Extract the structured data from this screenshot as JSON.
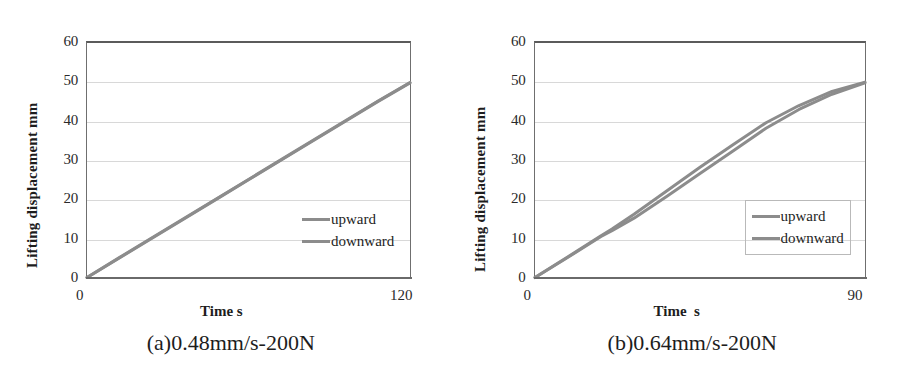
{
  "figure": {
    "background": "#ffffff",
    "series_color": "#8c8c8c",
    "grid_color": "#d8d8d8",
    "axis_color": "#6a6a6a"
  },
  "panels": [
    {
      "id": "a",
      "caption": "(a)0.48mm/s-200N",
      "xlabel": "Time s",
      "ylabel": "Lifting displacement mm",
      "xtick_min": "0",
      "xtick_max": "120",
      "yticks": [
        "60",
        "50",
        "40",
        "30",
        "20",
        "10",
        "0"
      ],
      "legend": [
        {
          "label": "upward",
          "color": "#8c8c8c"
        },
        {
          "label": "downward",
          "color": "#8c8c8c"
        }
      ]
    },
    {
      "id": "b",
      "caption": "(b)0.64mm/s-200N",
      "xlabel": "Time  s",
      "ylabel": "Lifting displacement  mm",
      "xtick_min": "0",
      "xtick_max": "90",
      "yticks": [
        "60",
        "50",
        "40",
        "30",
        "20",
        "10",
        "0"
      ],
      "legend": [
        {
          "label": "upward",
          "color": "#8c8c8c"
        },
        {
          "label": "downward",
          "color": "#8c8c8c"
        }
      ]
    }
  ],
  "chart_data": [
    {
      "type": "line",
      "panel": "a",
      "title": "(a)0.48mm/s-200N",
      "xlabel": "Time s",
      "ylabel": "Lifting displacement mm",
      "xlim": [
        0,
        120
      ],
      "ylim": [
        0,
        60
      ],
      "xticks": [
        0,
        120
      ],
      "yticks": [
        0,
        10,
        20,
        30,
        40,
        50,
        60
      ],
      "grid": "horizontal",
      "legend_position": "inside-right",
      "series": [
        {
          "name": "upward",
          "color": "#8c8c8c",
          "x": [
            0,
            12,
            24,
            36,
            48,
            60,
            72,
            84,
            96,
            108,
            120
          ],
          "values": [
            0,
            5.0,
            10.0,
            15.0,
            20.0,
            25.0,
            30.0,
            35.0,
            40.0,
            45.0,
            49.8
          ]
        },
        {
          "name": "downward",
          "color": "#8c8c8c",
          "x": [
            0,
            12,
            24,
            36,
            48,
            60,
            72,
            84,
            96,
            108,
            120
          ],
          "values": [
            0,
            5.1,
            10.1,
            15.1,
            20.1,
            25.1,
            30.1,
            35.1,
            40.1,
            45.1,
            49.9
          ]
        }
      ]
    },
    {
      "type": "line",
      "panel": "b",
      "title": "(b)0.64mm/s-200N",
      "xlabel": "Time  s",
      "ylabel": "Lifting displacement  mm",
      "xlim": [
        0,
        90
      ],
      "ylim": [
        0,
        60
      ],
      "xticks": [
        0,
        90
      ],
      "yticks": [
        0,
        10,
        20,
        30,
        40,
        50,
        60
      ],
      "grid": "horizontal",
      "legend_position": "inside-right",
      "series": [
        {
          "name": "upward",
          "color": "#8c8c8c",
          "x": [
            0,
            9,
            18,
            21,
            27,
            36,
            45,
            54,
            63,
            72,
            81,
            90
          ],
          "values": [
            0,
            5.3,
            10.7,
            12.4,
            16.2,
            22.2,
            28.2,
            34.0,
            39.6,
            44.0,
            47.6,
            50.0
          ]
        },
        {
          "name": "downward",
          "color": "#8c8c8c",
          "x": [
            0,
            9,
            18,
            21,
            27,
            36,
            45,
            54,
            63,
            72,
            81,
            90
          ],
          "values": [
            0,
            5.2,
            10.5,
            12.0,
            15.2,
            20.8,
            26.6,
            32.4,
            38.2,
            43.0,
            46.9,
            49.8
          ]
        }
      ]
    }
  ]
}
